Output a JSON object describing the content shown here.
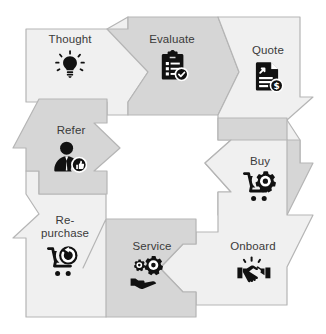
{
  "diagram": {
    "type": "cyclical-process",
    "shape": "square-loop",
    "direction": "clockwise",
    "colors": {
      "arrow_light_fill": "#f0f0f0",
      "arrow_dark_fill": "#d6d6d6",
      "arrow_outline": "#b5b5b5",
      "icon_color": "#111111",
      "label_color": "#3a3a3a",
      "background": "#ffffff"
    },
    "stages": [
      {
        "id": "thought",
        "label": "Thought",
        "icon": "lightbulb-icon",
        "fill": "light",
        "direction": "right",
        "order": 1
      },
      {
        "id": "evaluate",
        "label": "Evaluate",
        "icon": "clipboard-check-icon",
        "fill": "dark",
        "direction": "right",
        "order": 2
      },
      {
        "id": "quote",
        "label": "Quote",
        "icon": "document-dollar-icon",
        "fill": "light",
        "direction": "down",
        "order": 3
      },
      {
        "id": "buy",
        "label": "Buy",
        "icon": "cart-gear-icon",
        "fill": "dark",
        "direction": "down",
        "order": 4
      },
      {
        "id": "onboard",
        "label": "Onboard",
        "icon": "handshake-icon",
        "fill": "light",
        "direction": "left",
        "order": 5
      },
      {
        "id": "service",
        "label": "Service",
        "icon": "gears-hand-icon",
        "fill": "dark",
        "direction": "left",
        "order": 6
      },
      {
        "id": "repurchase",
        "label": "Re-\npurchase",
        "icon": "cart-refresh-icon",
        "fill": "light",
        "direction": "up",
        "order": 7
      },
      {
        "id": "refer",
        "label": "Refer",
        "icon": "person-thumbsup-icon",
        "fill": "dark",
        "direction": "up",
        "order": 8
      }
    ]
  }
}
